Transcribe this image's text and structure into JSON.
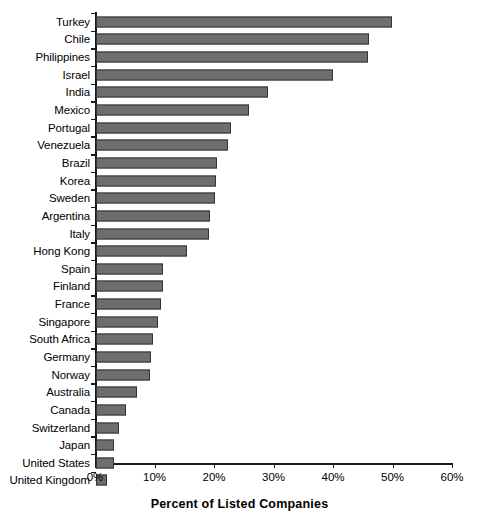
{
  "chart_data": {
    "type": "bar",
    "orientation": "horizontal",
    "title": "",
    "xlabel": "Percent of Listed Companies",
    "ylabel": "",
    "xlim": [
      0,
      60
    ],
    "xunit": "%",
    "xticks": [
      0,
      10,
      20,
      30,
      40,
      50,
      60
    ],
    "xtick_labels": [
      "0%",
      "10%",
      "20%",
      "30%",
      "40%",
      "50%",
      "60%"
    ],
    "grid": false,
    "legend": false,
    "bar_color": "#6e6e6e",
    "bar_edge_color": "#333333",
    "axis_color": "#1a1a1a",
    "categories": [
      "Turkey",
      "Chile",
      "Philippines",
      "Israel",
      "India",
      "Mexico",
      "Portugal",
      "Venezuela",
      "Brazil",
      "Korea",
      "Sweden",
      "Argentina",
      "Italy",
      "Hong Kong",
      "Spain",
      "Finland",
      "France",
      "Singapore",
      "South Africa",
      "Germany",
      "Norway",
      "Australia",
      "Canada",
      "Switzerland",
      "Japan",
      "United States",
      "United Kingdom"
    ],
    "values": [
      49.8,
      45.9,
      45.7,
      39.8,
      28.9,
      25.7,
      22.7,
      22.2,
      20.4,
      20.1,
      20.0,
      19.2,
      19.0,
      15.3,
      11.3,
      11.2,
      11.0,
      10.5,
      9.6,
      9.2,
      9.0,
      6.9,
      5.0,
      3.8,
      3.1,
      3.0,
      1.8
    ]
  }
}
